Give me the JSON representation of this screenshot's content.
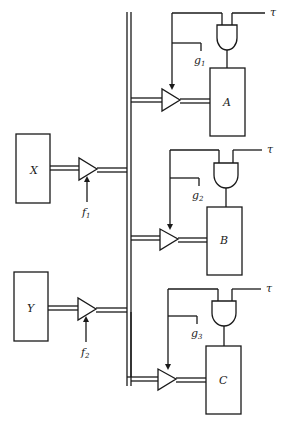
{
  "diagram": {
    "type": "block diagram",
    "sources": [
      {
        "id": "X",
        "label": "X",
        "enable": {
          "base": "f",
          "sub": "1"
        }
      },
      {
        "id": "Y",
        "label": "Y",
        "enable": {
          "base": "f",
          "sub": "2"
        }
      }
    ],
    "destinations": [
      {
        "id": "A",
        "label": "A",
        "gate": {
          "base": "g",
          "sub": "1"
        },
        "clock": "τ"
      },
      {
        "id": "B",
        "label": "B",
        "gate": {
          "base": "g",
          "sub": "2"
        },
        "clock": "τ"
      },
      {
        "id": "C",
        "label": "C",
        "gate": {
          "base": "g",
          "sub": "3"
        },
        "clock": "τ"
      }
    ],
    "bus": "shared double-line data bus",
    "colors": {
      "line": "#1a1a1a",
      "background": "#ffffff"
    }
  }
}
